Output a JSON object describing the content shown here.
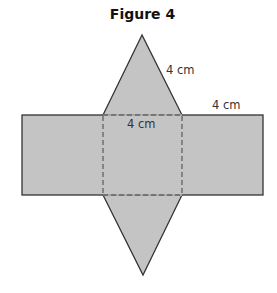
{
  "figure": {
    "title": "Figure 4",
    "labels": {
      "slant_edge": "4 cm",
      "rect_edge": "4 cm",
      "square_edge": "4 cm"
    },
    "colors": {
      "fill": "#c4c4c4",
      "stroke": "#333333"
    }
  }
}
